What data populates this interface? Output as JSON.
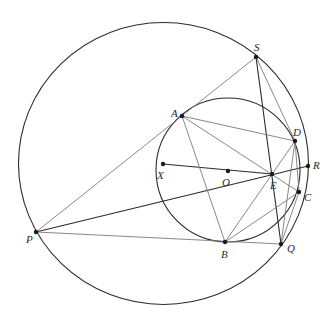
{
  "diagram": {
    "width": 335,
    "height": 319,
    "background": "#ffffff",
    "stroke_dark": "#2b2b2b",
    "stroke_light": "#7a7a7a",
    "circles": [
      {
        "name": "circumcircle-big",
        "center": "X",
        "cx": 163.5,
        "cy": 163.5,
        "rx": 145,
        "ry": 141,
        "color": "#2b2b2b",
        "width": 1.1
      },
      {
        "name": "circle-small",
        "center": "O",
        "cx": 228,
        "cy": 170,
        "rx": 72,
        "ry": 72,
        "color": "#2b2b2b",
        "width": 1.1
      }
    ],
    "points": {
      "S": {
        "x": 256,
        "y": 57
      },
      "A": {
        "x": 182,
        "y": 116
      },
      "D": {
        "x": 295,
        "y": 141
      },
      "R": {
        "x": 308,
        "y": 166
      },
      "X": {
        "x": 163,
        "y": 164
      },
      "O": {
        "x": 228,
        "y": 171
      },
      "E": {
        "x": 272,
        "y": 174
      },
      "C": {
        "x": 299,
        "y": 192
      },
      "P": {
        "x": 36,
        "y": 232
      },
      "B": {
        "x": 225,
        "y": 242
      },
      "Q": {
        "x": 281,
        "y": 244
      }
    },
    "segments": [
      {
        "from": "P",
        "to": "S",
        "style": "light"
      },
      {
        "from": "P",
        "to": "R",
        "style": "dark"
      },
      {
        "from": "P",
        "to": "Q",
        "style": "light"
      },
      {
        "from": "S",
        "to": "Q",
        "style": "dark"
      },
      {
        "from": "S",
        "to": "D",
        "style": "light"
      },
      {
        "from": "X",
        "to": "E",
        "style": "dark"
      },
      {
        "from": "A",
        "to": "D",
        "style": "light"
      },
      {
        "from": "A",
        "to": "C",
        "style": "light"
      },
      {
        "from": "A",
        "to": "B",
        "style": "light"
      },
      {
        "from": "B",
        "to": "D",
        "style": "light"
      },
      {
        "from": "B",
        "to": "C",
        "style": "light"
      },
      {
        "from": "D",
        "to": "C",
        "style": "light"
      },
      {
        "from": "Q",
        "to": "C",
        "style": "light"
      },
      {
        "from": "Q",
        "to": "D",
        "style": "light"
      }
    ],
    "labels": [
      {
        "text": "S",
        "x": 254,
        "y": 42
      },
      {
        "text": "A",
        "x": 171,
        "y": 108
      },
      {
        "text": "D",
        "x": 293,
        "y": 127
      },
      {
        "text": "R",
        "x": 313,
        "y": 160
      },
      {
        "text": "X",
        "x": 157,
        "y": 170
      },
      {
        "text": "O",
        "x": 222,
        "y": 177
      },
      {
        "text": "E",
        "x": 270,
        "y": 180
      },
      {
        "text": "C",
        "x": 304,
        "y": 192
      },
      {
        "text": "P",
        "x": 26,
        "y": 234
      },
      {
        "text": "B",
        "x": 221,
        "y": 249
      },
      {
        "text": "Q",
        "x": 287,
        "y": 243
      }
    ]
  }
}
